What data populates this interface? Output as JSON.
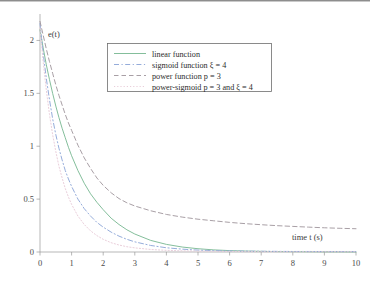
{
  "chart_data": {
    "type": "line",
    "title": "",
    "xlabel": "time t (s)",
    "ylabel": "e(t)",
    "xlim": [
      0,
      10
    ],
    "ylim": [
      0,
      2.25
    ],
    "grid": false,
    "legend_position": "top-center",
    "xticks": [
      "0",
      "1",
      "2",
      "3",
      "4",
      "5",
      "6",
      "7",
      "8",
      "9",
      "10"
    ],
    "xtick_values": [
      0,
      1,
      2,
      3,
      4,
      5,
      6,
      7,
      8,
      9,
      10
    ],
    "yticks": [
      "0",
      "0.5",
      "1",
      "1.5",
      "2"
    ],
    "ytick_values": [
      0,
      0.5,
      1,
      1.5,
      2
    ],
    "x": [
      0,
      0.1,
      0.2,
      0.3,
      0.4,
      0.5,
      0.6,
      0.7,
      0.8,
      0.9,
      1.0,
      1.2,
      1.4,
      1.6,
      1.8,
      2.0,
      2.25,
      2.5,
      2.75,
      3.0,
      3.5,
      4.0,
      4.5,
      5.0,
      5.5,
      6.0,
      6.5,
      7.0,
      7.5,
      8.0,
      8.5,
      9.0,
      9.5,
      10.0
    ],
    "series": [
      {
        "name": "linear function",
        "label": "linear function",
        "color": "#7dba96",
        "style": "solid",
        "values": [
          2.1,
          1.93,
          1.77,
          1.63,
          1.5,
          1.38,
          1.27,
          1.17,
          1.08,
          0.99,
          0.91,
          0.77,
          0.65,
          0.55,
          0.47,
          0.4,
          0.32,
          0.26,
          0.21,
          0.17,
          0.11,
          0.072,
          0.047,
          0.031,
          0.02,
          0.013,
          0.009,
          0.006,
          0.004,
          0.003,
          0.002,
          0.001,
          0.001,
          0.0
        ]
      },
      {
        "name": "sigmoid function",
        "label": "sigmoid function ξ = 4",
        "color": "#8fa8d8",
        "style": "dash-dot",
        "values": [
          2.16,
          1.88,
          1.64,
          1.44,
          1.26,
          1.11,
          0.98,
          0.87,
          0.77,
          0.69,
          0.62,
          0.5,
          0.41,
          0.34,
          0.28,
          0.235,
          0.188,
          0.15,
          0.12,
          0.096,
          0.062,
          0.04,
          0.027,
          0.018,
          0.013,
          0.01,
          0.008,
          0.007,
          0.006,
          0.005,
          0.005,
          0.004,
          0.004,
          0.004
        ]
      },
      {
        "name": "power function",
        "label": "power function p = 3",
        "color": "#a39aa0",
        "style": "dashed",
        "values": [
          2.18,
          2.05,
          1.92,
          1.8,
          1.69,
          1.58,
          1.48,
          1.39,
          1.3,
          1.22,
          1.15,
          1.01,
          0.89,
          0.79,
          0.7,
          0.63,
          0.56,
          0.505,
          0.465,
          0.435,
          0.39,
          0.355,
          0.33,
          0.31,
          0.295,
          0.28,
          0.268,
          0.258,
          0.249,
          0.242,
          0.235,
          0.229,
          0.224,
          0.22
        ]
      },
      {
        "name": "power-sigmoid",
        "label": "power-sigmoid p = 3 and ξ = 4",
        "color": "#e8cbd8",
        "style": "dotted",
        "values": [
          2.12,
          1.8,
          1.53,
          1.3,
          1.11,
          0.95,
          0.81,
          0.7,
          0.6,
          0.52,
          0.45,
          0.34,
          0.26,
          0.2,
          0.155,
          0.12,
          0.088,
          0.066,
          0.05,
          0.039,
          0.024,
          0.016,
          0.011,
          0.008,
          0.006,
          0.005,
          0.004,
          0.003,
          0.003,
          0.002,
          0.002,
          0.002,
          0.002,
          0.002
        ]
      }
    ],
    "legend_entries": [
      {
        "label": "linear function",
        "color": "#7dba96",
        "style": "solid"
      },
      {
        "label": "sigmoid function ξ = 4",
        "color": "#8fa8d8",
        "style": "dash-dot"
      },
      {
        "label": "power function p = 3",
        "color": "#a39aa0",
        "style": "dashed"
      },
      {
        "label": "power-sigmoid p = 3 and ξ = 4",
        "color": "#e8cbd8",
        "style": "dotted"
      }
    ]
  }
}
